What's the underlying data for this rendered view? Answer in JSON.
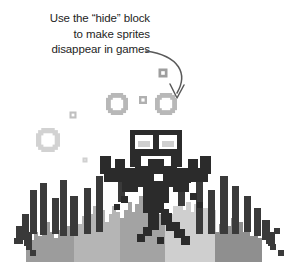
{
  "illustration": {
    "caption": {
      "line1": "Use the “hide” block",
      "line2": "to make sprites",
      "line3": "disappear in games",
      "full_text": "Use the “hide” block\nto make sprites\ndisappear in games"
    },
    "pointer": {
      "type": "curved-arrow",
      "description": "curved arrow pointing down-right from end of caption toward the sprite",
      "color": "#5a5a5a",
      "start": [
        146,
        51
      ],
      "control1": [
        183,
        57
      ],
      "control2": [
        186,
        75
      ],
      "end": [
        176,
        97
      ]
    },
    "scene_title": "pixel sprite disappearing over grass",
    "background_color": "#ffffff",
    "palette": {
      "black": "#2b2b2b",
      "dark_gray": "#4a4a4a",
      "mid_gray": "#8e8e8e",
      "light_gray": "#a8a8a8",
      "lighter_gray": "#c2c2c2",
      "pale_gray": "#d6d6d6",
      "white": "#ffffff"
    },
    "sprite": {
      "name": "bat-monster-sprite",
      "body_color": "#2b2b2b",
      "eye_color": "#ffffff",
      "eye_count": 2,
      "state": "dissolving"
    },
    "particles": [
      {
        "shape": "ring",
        "x": 48,
        "y": 140,
        "size": 24,
        "color": "#d2d2d2"
      },
      {
        "shape": "ring",
        "x": 117,
        "y": 104,
        "size": 22,
        "color": "#b8b8b8"
      },
      {
        "shape": "ring",
        "x": 166,
        "y": 104,
        "size": 22,
        "color": "#b8b8b8"
      },
      {
        "shape": "square",
        "x": 143,
        "y": 100,
        "size": 8,
        "color": "#b0b0b0"
      },
      {
        "shape": "square",
        "x": 163,
        "y": 73,
        "size": 9,
        "color": "#9e9e9e"
      },
      {
        "shape": "square",
        "x": 73,
        "y": 115,
        "size": 7,
        "color": "#c0c0c0"
      },
      {
        "shape": "square",
        "x": 85,
        "y": 160,
        "size": 5,
        "color": "#d0d0d0"
      }
    ],
    "terrain": {
      "name": "pixel-grass-silhouette",
      "band_colors": [
        "#9c9c9c",
        "#b5b5b5",
        "#a3a3a3",
        "#cfcfcf",
        "#8f8f8f"
      ],
      "blade_color": "#3a3a3a",
      "baseline_y": 262
    }
  }
}
